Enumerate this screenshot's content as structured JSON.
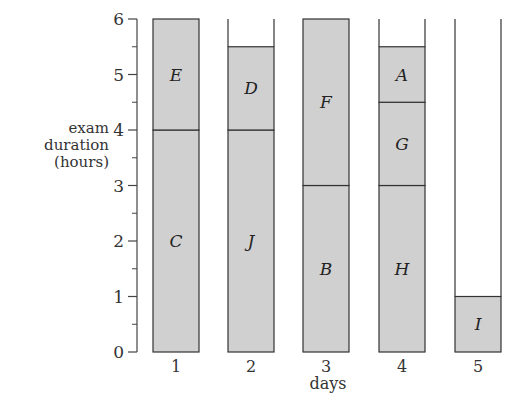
{
  "chart_data": {
    "type": "bar",
    "stacked": true,
    "title": "",
    "xlabel": "days",
    "ylabel": "exam\nduration\n(hours)",
    "ylabel_lines": [
      "exam",
      "duration",
      "(hours)"
    ],
    "ylim": [
      0,
      6
    ],
    "yticks": [
      0,
      1,
      2,
      3,
      4,
      5,
      6
    ],
    "yticks_minor": [
      0.5,
      1.5,
      2.5,
      3.5,
      4.5,
      5.5
    ],
    "categories": [
      "1",
      "2",
      "3",
      "4",
      "5"
    ],
    "capacity_per_day": 6,
    "grid": false,
    "legend": "none",
    "fill_color": "#d0d0d0",
    "empty_color": "#ffffff",
    "edge_color": "#333333",
    "days": [
      {
        "day": "1",
        "blocks": [
          {
            "label": "C",
            "start": 0,
            "end": 4
          },
          {
            "label": "E",
            "start": 4,
            "end": 6
          }
        ]
      },
      {
        "day": "2",
        "blocks": [
          {
            "label": "J",
            "start": 0,
            "end": 4
          },
          {
            "label": "D",
            "start": 4,
            "end": 5.5
          }
        ]
      },
      {
        "day": "3",
        "blocks": [
          {
            "label": "B",
            "start": 0,
            "end": 3
          },
          {
            "label": "F",
            "start": 3,
            "end": 6
          }
        ]
      },
      {
        "day": "4",
        "blocks": [
          {
            "label": "H",
            "start": 0,
            "end": 3
          },
          {
            "label": "G",
            "start": 3,
            "end": 4.5
          },
          {
            "label": "A",
            "start": 4.5,
            "end": 5.5
          }
        ]
      },
      {
        "day": "5",
        "blocks": [
          {
            "label": "I",
            "start": 0,
            "end": 1
          }
        ]
      }
    ],
    "series": [
      {
        "name": "bottom block",
        "labels": [
          "C",
          "J",
          "B",
          "H",
          "I"
        ],
        "values": [
          4,
          4,
          3,
          3,
          1
        ]
      },
      {
        "name": "middle block",
        "labels": [
          "E",
          "D",
          "F",
          "G",
          ""
        ],
        "values": [
          2,
          1.5,
          3,
          1.5,
          0
        ]
      },
      {
        "name": "top block",
        "labels": [
          "",
          "",
          "",
          "A",
          ""
        ],
        "values": [
          0,
          0,
          0,
          1,
          0
        ]
      }
    ],
    "totals": [
      6,
      5.5,
      6,
      5.5,
      1
    ]
  }
}
